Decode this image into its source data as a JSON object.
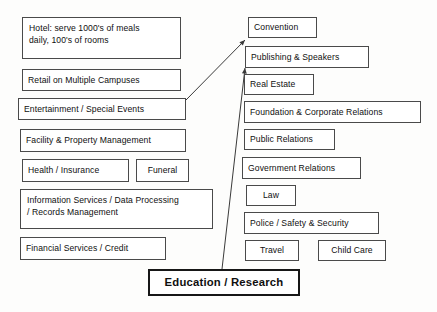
{
  "diagram": {
    "title": "Education / Research",
    "style": {
      "background": "#fdfdfc",
      "box_border": "#4a4a4a",
      "root_border": "#171717",
      "text": "#0f0f0f",
      "connector": "#3a3a3a"
    },
    "root": {
      "label": "Education / Research",
      "x": 148,
      "y": 269,
      "w": 152,
      "h": 27
    },
    "left_column": [
      {
        "label": "Hotel: serve 1000's of meals\ndaily, 100's of rooms",
        "x": 22,
        "y": 17,
        "w": 159,
        "h": 42,
        "multiline": true
      },
      {
        "label": "Retail on Multiple Campuses",
        "x": 22,
        "y": 69,
        "w": 159,
        "h": 22,
        "multiline": false
      },
      {
        "label": "Entertainment / Special Events",
        "x": 18,
        "y": 98,
        "w": 168,
        "h": 22,
        "multiline": false
      },
      {
        "label": "Facility & Property Management",
        "x": 20,
        "y": 129,
        "w": 166,
        "h": 23,
        "multiline": false
      },
      {
        "label": "Health / Insurance",
        "x": 22,
        "y": 159,
        "w": 107,
        "h": 23,
        "multiline": false
      },
      {
        "label": "Funeral",
        "x": 136,
        "y": 159,
        "w": 53,
        "h": 23,
        "multiline": false,
        "center": true
      },
      {
        "label": "Information Services / Data Processing\n/ Records Management",
        "x": 20,
        "y": 189,
        "w": 193,
        "h": 40,
        "multiline": true
      },
      {
        "label": "Financial Services / Credit",
        "x": 20,
        "y": 237,
        "w": 146,
        "h": 23,
        "multiline": false
      }
    ],
    "right_column": [
      {
        "label": "Convention",
        "x": 248,
        "y": 17,
        "w": 69,
        "h": 21,
        "multiline": false
      },
      {
        "label": "Publishing & Speakers",
        "x": 245,
        "y": 46,
        "w": 124,
        "h": 22,
        "multiline": false
      },
      {
        "label": "Real Estate",
        "x": 244,
        "y": 74,
        "w": 70,
        "h": 21,
        "multiline": false
      },
      {
        "label": "Foundation & Corporate Relations",
        "x": 244,
        "y": 101,
        "w": 177,
        "h": 22,
        "multiline": false
      },
      {
        "label": "Public Relations",
        "x": 244,
        "y": 129,
        "w": 91,
        "h": 21,
        "multiline": false
      },
      {
        "label": "Government Relations",
        "x": 242,
        "y": 157,
        "w": 119,
        "h": 22,
        "multiline": false
      },
      {
        "label": "Law",
        "x": 246,
        "y": 185,
        "w": 50,
        "h": 21,
        "multiline": false,
        "center": true
      },
      {
        "label": "Police / Safety & Security",
        "x": 244,
        "y": 212,
        "w": 135,
        "h": 22,
        "multiline": false
      },
      {
        "label": "Travel",
        "x": 245,
        "y": 240,
        "w": 54,
        "h": 21,
        "multiline": false,
        "center": true
      },
      {
        "label": "Child Care",
        "x": 318,
        "y": 240,
        "w": 68,
        "h": 21,
        "multiline": false,
        "center": true
      }
    ],
    "connectors": [
      {
        "name": "entertainment-to-convention",
        "from": [
          186,
          100
        ],
        "to": [
          245,
          40
        ],
        "arrow": "end"
      },
      {
        "name": "education-to-publishing",
        "from": [
          222,
          269
        ],
        "to": [
          245,
          68
        ],
        "arrow": "end"
      }
    ]
  }
}
